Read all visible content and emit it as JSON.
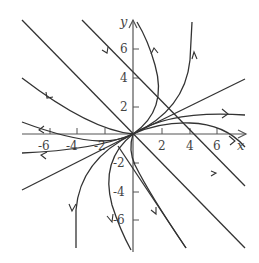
{
  "diagram": {
    "axes": {
      "x_label": "x",
      "y_label": "y",
      "x_ticks": [
        "-6",
        "-4",
        "-2",
        "2",
        "4",
        "6"
      ],
      "y_ticks": [
        "6",
        "4",
        "2",
        "-2",
        "-4",
        "-6"
      ],
      "range": [
        -7,
        7
      ]
    },
    "trajectories": [
      {
        "name": "eigenline-y-eq-neg-x",
        "d": "M22,20 L245,248"
      },
      {
        "name": "eigenline-y-eq-half-x-upper",
        "d": "M133,134 L245,79"
      },
      {
        "name": "eigenline-y-eq-half-x-lower",
        "d": "M133,134 L22,190"
      },
      {
        "name": "line-upper-left-1",
        "d": "M82,20 L245,186"
      },
      {
        "name": "line-lower-right-1",
        "d": "M118,146 L186,248"
      },
      {
        "name": "curve-upper-left",
        "d": "M22,78 Q90,130 133,134"
      },
      {
        "name": "curve-upper-left-2",
        "d": "M22,122 Q70,140 100,141 Q120,141 133,134"
      },
      {
        "name": "curve-right-1",
        "d": "M133,134 Q160,122 190,123 Q225,124 245,147"
      },
      {
        "name": "curve-right-2",
        "d": "M133,134 Q170,110 245,115"
      },
      {
        "name": "curve-upper-right-1",
        "d": "M133,134 Q185,110 190,60 L192,22"
      },
      {
        "name": "curve-upper-right-loop",
        "d": "M133,134 Q168,110 155,65 Q148,40 137,22"
      },
      {
        "name": "curve-lower-left-1",
        "d": "M133,134 Q95,150 22,153"
      },
      {
        "name": "curve-lower-left-2",
        "d": "M133,134 Q80,160 76,210 L76,248"
      },
      {
        "name": "curve-lower-left-loop",
        "d": "M133,134 Q100,160 112,205 Q120,230 131,250"
      },
      {
        "name": "curve-lower-right-loop",
        "d": "M133,134 Q128,150 135,165 Q150,195 186,248"
      }
    ],
    "arrows": [
      {
        "name": "arrow-line-upper-left-1",
        "d": "M102,50 L107,53 L108,47"
      },
      {
        "name": "arrow-curve-upper-left",
        "d": "M46,92 L47,98 L53,97"
      },
      {
        "name": "arrow-curve-upper-left-2",
        "d": "M44,126 L39,130 L44,133"
      },
      {
        "name": "arrow-curve-lower-left-1",
        "d": "M47,152 L41,155 L46,159"
      },
      {
        "name": "arrow-curve-lower-left-2",
        "d": "M69,204 L72,211 L76,204"
      },
      {
        "name": "arrow-curve-lower-left-loop",
        "d": "M107,216 L112,222 L113,214"
      },
      {
        "name": "arrow-curve-upper-right-loop",
        "d": "M151,54 L154,48 L158,53"
      },
      {
        "name": "arrow-curve-upper-right-1",
        "d": "M192,59 L194,52 L197,59"
      },
      {
        "name": "arrow-curve-right-2",
        "d": "M222,109 L228,114 L222,118"
      },
      {
        "name": "arrow-curve-right-1",
        "d": "M229,136 L235,141 L230,145"
      },
      {
        "name": "arrow-line-lower-right",
        "d": "M211,171 L216,173 L211,176"
      },
      {
        "name": "arrow-lower-right-loop",
        "d": "M151,210 L156,214 L156,207"
      }
    ]
  }
}
